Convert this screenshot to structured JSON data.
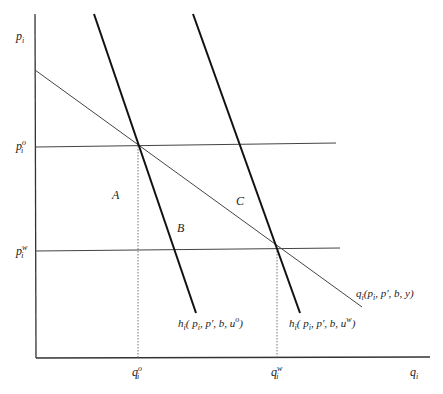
{
  "diagram": {
    "type": "economics-supply-demand",
    "axes": {
      "y_label": "p",
      "y_label_sub": "i",
      "x_label": "q",
      "x_label_sub": "i"
    },
    "price_levels": [
      {
        "id": "p_o",
        "base": "p",
        "sub": "i",
        "sup": "o"
      },
      {
        "id": "p_w",
        "base": "p",
        "sub": "i",
        "sup": "w"
      }
    ],
    "quantity_levels": [
      {
        "id": "q_o",
        "base": "q",
        "sub": "i",
        "sup": "o"
      },
      {
        "id": "q_w",
        "base": "q",
        "sub": "i",
        "sup": "w"
      }
    ],
    "areas": {
      "A": "A",
      "B": "B",
      "C": "C"
    },
    "curves": {
      "marshallian": {
        "prefix": "q",
        "sub": "i",
        "args": "(p",
        "args_sub": "i",
        "rest": ", p′, b, y)"
      },
      "hicksian_o": {
        "prefix": "h",
        "sub": "i",
        "args": "( p",
        "args_sub": "i",
        "rest": ", p′, b, u",
        "sup": "o",
        "close": ")"
      },
      "hicksian_w": {
        "prefix": "h",
        "sub": "i",
        "args": "( p",
        "args_sub": "i",
        "rest": ", p′, b, u",
        "sup": "w",
        "close": ")"
      }
    },
    "colors": {
      "line": "#333333",
      "thick": "#111111",
      "dotted": "#888888"
    }
  }
}
